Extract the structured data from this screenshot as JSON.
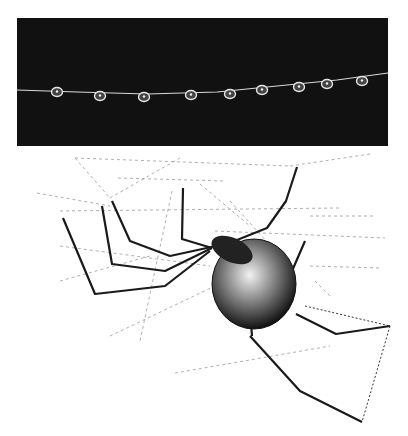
{
  "figure": {
    "photo": {
      "subject": "dew droplets on a silk thread",
      "background_color": "#111111",
      "thread_color": "#d8d8d8",
      "droplet_count": 9,
      "droplets": [
        {
          "x": 40,
          "y": 72
        },
        {
          "x": 83,
          "y": 76
        },
        {
          "x": 127,
          "y": 77
        },
        {
          "x": 174,
          "y": 75
        },
        {
          "x": 213,
          "y": 74
        },
        {
          "x": 245,
          "y": 70
        },
        {
          "x": 282,
          "y": 67
        },
        {
          "x": 310,
          "y": 64
        },
        {
          "x": 345,
          "y": 61
        }
      ]
    },
    "drawing": {
      "subject": "cobweb spider hanging in tangle web",
      "ink_color": "#1a1a1a",
      "web_color": "#9a9a9a"
    }
  }
}
